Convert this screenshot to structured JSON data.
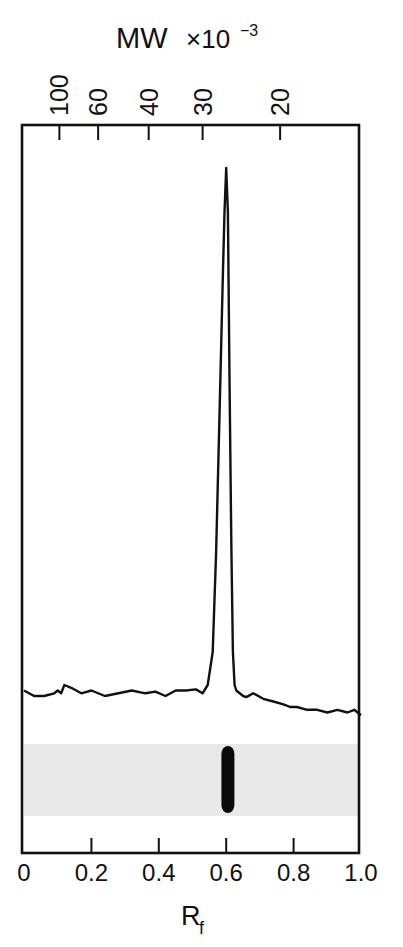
{
  "chart_data": {
    "type": "line",
    "title": "",
    "top_axis": {
      "label": "MW",
      "multiplier": "×10",
      "exponent": "−3",
      "ticks": [
        {
          "label": "100",
          "rf": 0.105
        },
        {
          "label": "60",
          "rf": 0.22
        },
        {
          "label": "40",
          "rf": 0.37
        },
        {
          "label": "30",
          "rf": 0.53
        },
        {
          "label": "20",
          "rf": 0.76
        }
      ]
    },
    "bottom_axis": {
      "label": "R",
      "label_sub": "f",
      "range": [
        0,
        1.0
      ],
      "ticks": [
        "0",
        "0.2",
        "0.4",
        "0.6",
        "0.8",
        "1.0"
      ]
    },
    "series": [
      {
        "name": "densitometer scan",
        "x": [
          0.0,
          0.03,
          0.06,
          0.09,
          0.1,
          0.11,
          0.12,
          0.14,
          0.17,
          0.2,
          0.24,
          0.28,
          0.32,
          0.36,
          0.39,
          0.42,
          0.45,
          0.48,
          0.51,
          0.53,
          0.545,
          0.56,
          0.57,
          0.58,
          0.59,
          0.595,
          0.6,
          0.605,
          0.61,
          0.615,
          0.62,
          0.625,
          0.63,
          0.64,
          0.65,
          0.66,
          0.68,
          0.71,
          0.74,
          0.77,
          0.79,
          0.81,
          0.84,
          0.87,
          0.9,
          0.93,
          0.96,
          0.98,
          1.0
        ],
        "y": [
          0.05,
          0.04,
          0.04,
          0.045,
          0.05,
          0.045,
          0.06,
          0.055,
          0.045,
          0.05,
          0.04,
          0.045,
          0.05,
          0.045,
          0.048,
          0.04,
          0.05,
          0.05,
          0.052,
          0.045,
          0.06,
          0.12,
          0.3,
          0.55,
          0.8,
          0.92,
          1.0,
          0.92,
          0.6,
          0.32,
          0.12,
          0.06,
          0.05,
          0.045,
          0.04,
          0.038,
          0.045,
          0.035,
          0.03,
          0.025,
          0.02,
          0.02,
          0.015,
          0.015,
          0.01,
          0.015,
          0.01,
          0.015,
          0.005
        ]
      }
    ],
    "peak": {
      "rf": 0.61,
      "mw_kda": 27
    },
    "gel_band": {
      "rf": 0.605
    },
    "ylabel": "",
    "grid": false,
    "legend": null
  }
}
